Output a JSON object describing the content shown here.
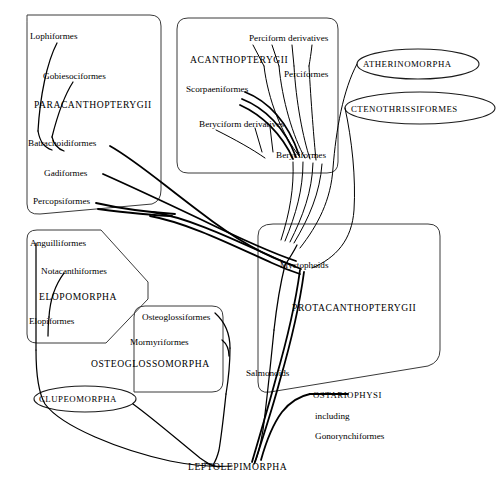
{
  "figure": {
    "type": "cladogram",
    "background_color": "#ffffff",
    "line_color": "#000000",
    "box_stroke_color": "#3a3a3a",
    "caption": ""
  },
  "groups": {
    "paracanthopterygii": {
      "name": "PARACANTHOPTERYGII",
      "shape": "rounded-rectangle",
      "members": [
        "Lophiformes",
        "Gobiesociformes",
        "Batrachoidiformes",
        "Gadiformes",
        "Percopsiformes"
      ]
    },
    "acanthopterygii": {
      "name": "ACANTHOPTERYGII",
      "shape": "rounded-rectangle",
      "members": [
        "Perciform derivatives",
        "Perciformes",
        "Scorpaeniformes",
        "Beryciform derivatives",
        "Beryciformes"
      ]
    },
    "atherinomorpha": {
      "name": "ATHERINOMORPHA",
      "shape": "ellipse",
      "members": []
    },
    "ctenothrissiformes": {
      "name": "CTENOTHRISSIFORMES",
      "shape": "ellipse",
      "members": []
    },
    "protacanthopterygii": {
      "name": "PROTACANTHOPTERYGII",
      "shape": "rounded-rectangle",
      "members": [
        "Myctophoids",
        "Salmonoids"
      ]
    },
    "elopomorpha": {
      "name": "ELOPOMORPHA",
      "shape": "polygon",
      "members": [
        "Anguilliformes",
        "Notacanthiformes",
        "Elopiformes"
      ]
    },
    "osteoglossomorpha": {
      "name": "OSTEOGLOSSOMORPHA",
      "shape": "rounded-rectangle",
      "members": [
        "Osteoglossiformes",
        "Mormyriformes"
      ]
    },
    "clupeomorpha": {
      "name": "CLUPEOMORPHA",
      "shape": "ellipse",
      "members": []
    },
    "ostariophysi": {
      "name": "OSTARIOPHYSI",
      "line2": "including",
      "line3": "Gonorynchiformes",
      "shape": "label-only",
      "members": []
    },
    "leptolepimorpha": {
      "name": "LEPTOLEPIMORPHA",
      "shape": "label-only",
      "members": []
    }
  },
  "labels": {
    "lophiformes": "Lophiformes",
    "gobiesociformes": "Gobiesociformes",
    "paracanthopterygii": "PARACANTHOPTERYGII",
    "batrachoidiformes": "Batrachoidiformes",
    "gadiformes": "Gadiformes",
    "percopsiformes": "Percopsiformes",
    "perciform_derivatives": "Perciform derivatives",
    "acanthopterygii": "ACANTHOPTERYGII",
    "perciformes": "Perciformes",
    "scorpaeniformes": "Scorpaeniformes",
    "beryciform_derivatives": "Beryciform derivatives",
    "beryciformes": "Beryciformes",
    "atherinomorpha": "ATHERINOMORPHA",
    "ctenothrissiformes": "CTENOTHRISSIFORMES",
    "myctophoids": "Myctophoids",
    "protacanthopterygii": "PROTACANTHOPTERYGII",
    "salmonoids": "Salmonoids",
    "anguilliformes": "Anguilliformes",
    "notacanthiformes": "Notacanthiformes",
    "elopomorpha": "ELOPOMORPHA",
    "elopiformes": "Elopiformes",
    "osteoglossiformes": "Osteoglossiformes",
    "mormyriformes": "Mormyriformes",
    "osteoglossomorpha": "OSTEOGLOSSOMORPHA",
    "clupeomorpha": "CLUPEOMORPHA",
    "ostariophysi": "OSTARIOPHYSI",
    "ostariophysi_including": "including",
    "ostariophysi_gonorynchiformes": "Gonorynchiformes",
    "leptolepimorpha": "LEPTOLEPIMORPHA"
  }
}
